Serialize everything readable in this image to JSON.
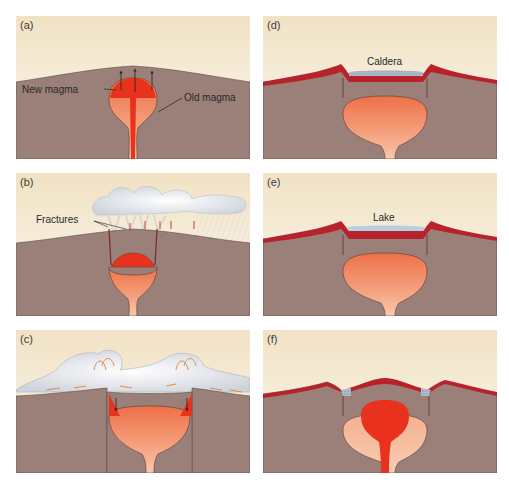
{
  "figure": {
    "colors": {
      "sky_top": "#f3e6cc",
      "sky_bottom": "#fbf8f0",
      "crust": "#9a8078",
      "old_magma_top": "#ef7a50",
      "old_magma_bottom": "#f7c3a6",
      "new_magma": "#e8321e",
      "lava_flow": "#b8222a",
      "ash_cloud": "#e6e8ec",
      "lake": "#b7cfe0",
      "outline": "#4a3a34"
    },
    "panels": [
      {
        "id": "a",
        "label": "(a)",
        "annotations": [
          "New magma",
          "Old magma"
        ]
      },
      {
        "id": "b",
        "label": "(b)",
        "annotations": [
          "Fractures"
        ]
      },
      {
        "id": "c",
        "label": "(c)",
        "annotations": []
      },
      {
        "id": "d",
        "label": "(d)",
        "annotations": [
          "Caldera"
        ]
      },
      {
        "id": "e",
        "label": "(e)",
        "annotations": [
          "Lake"
        ]
      },
      {
        "id": "f",
        "label": "(f)",
        "annotations": []
      }
    ]
  }
}
